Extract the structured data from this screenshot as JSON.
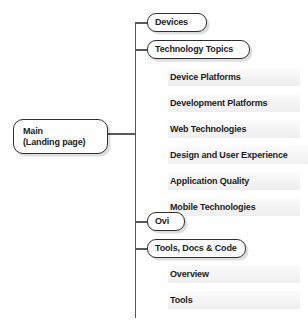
{
  "diagram": {
    "type": "site-map-tree",
    "colors": {
      "line": "#58585a",
      "node_border": "#2f2f31",
      "node_fill": "#ffffff",
      "subitem_fill": "#f4f4f4",
      "text": "#1b1b1d"
    },
    "root": {
      "title": "Main",
      "subtitle": "(Landing page)"
    },
    "branches": [
      {
        "label": "Devices",
        "children": []
      },
      {
        "label": "Technology Topics",
        "children": [
          "Device Platforms",
          "Development Platforms",
          "Web Technologies",
          "Design and User Experience",
          "Application Quality",
          "Mobile Technologies"
        ]
      },
      {
        "label": "Ovi",
        "children": []
      },
      {
        "label": "Tools, Docs & Code",
        "children": [
          "Overview",
          "Tools"
        ]
      }
    ]
  }
}
